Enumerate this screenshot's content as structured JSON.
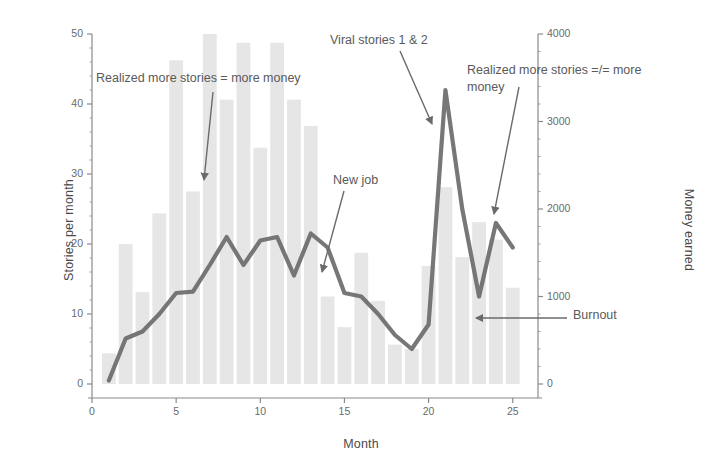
{
  "chart_data": {
    "type": "bar",
    "title": "",
    "subtitle": "",
    "xlabel": "Month",
    "ylabel": "Stories per month",
    "ylabel_right": "Money earned",
    "x": [
      1,
      2,
      3,
      4,
      5,
      6,
      7,
      8,
      9,
      10,
      11,
      12,
      13,
      14,
      15,
      16,
      17,
      18,
      19,
      20,
      21,
      22,
      23,
      24,
      25
    ],
    "categories": [
      "1",
      "2",
      "3",
      "4",
      "5",
      "6",
      "7",
      "8",
      "9",
      "10",
      "11",
      "12",
      "13",
      "14",
      "15",
      "16",
      "17",
      "18",
      "19",
      "20",
      "21",
      "22",
      "23",
      "24",
      "25"
    ],
    "xlim": [
      0,
      26.5
    ],
    "ylim": [
      0,
      50
    ],
    "ylim_right": [
      0,
      4000
    ],
    "xticks": [
      0,
      5,
      10,
      15,
      20,
      25
    ],
    "xtick_labels": [
      "0",
      "5",
      "10",
      "15",
      "20",
      "25"
    ],
    "yticks": [
      0,
      10,
      20,
      30,
      40,
      50
    ],
    "ytick_labels": [
      "0",
      "10",
      "20",
      "30",
      "40",
      "50"
    ],
    "yticks_right": [
      0,
      1000,
      2000,
      3000,
      4000
    ],
    "ytick_labels_right": [
      "0",
      "1000",
      "2000",
      "3000",
      "4000"
    ],
    "grid": false,
    "legend": false,
    "legend_position": "none",
    "bar_color": "#e6e6e6",
    "line_color": "#6b6b6b",
    "series": [
      {
        "name": "Money earned",
        "type": "bar",
        "axis": "right",
        "color": "#e6e6e6",
        "values": [
          350,
          1600,
          1050,
          1950,
          3700,
          2200,
          4000,
          3250,
          3900,
          2700,
          3900,
          3250,
          2950,
          1000,
          650,
          1500,
          950,
          450,
          400,
          1350,
          2250,
          1450,
          1850,
          1650,
          1100
        ]
      },
      {
        "name": "Stories per month",
        "type": "line",
        "axis": "left",
        "color": "#6b6b6b",
        "values": [
          0.5,
          6.5,
          7.5,
          10,
          13,
          13.2,
          17,
          21,
          17,
          20.5,
          21,
          15.5,
          21.5,
          19.5,
          13,
          12.5,
          10,
          7,
          5,
          8.5,
          42,
          25,
          12.5,
          23,
          19.5
        ]
      }
    ],
    "annotations": [
      {
        "id": "realized-more-money",
        "text": "Realized more stories = more money",
        "text_x": 96,
        "text_y": 70,
        "align": "left",
        "arrow_from_x": 213,
        "arrow_from_y": 92,
        "arrow_to_x": 204,
        "arrow_to_y": 180
      },
      {
        "id": "viral-stories",
        "text": "Viral stories 1 & 2",
        "text_x": 330,
        "text_y": 32,
        "align": "left",
        "arrow_from_x": 400,
        "arrow_from_y": 51,
        "arrow_to_x": 432,
        "arrow_to_y": 124
      },
      {
        "id": "new-job",
        "text": "New job",
        "text_x": 333,
        "text_y": 172,
        "align": "left",
        "arrow_from_x": 344,
        "arrow_from_y": 191,
        "arrow_to_x": 322,
        "arrow_to_y": 272
      },
      {
        "id": "realized-not-more-money",
        "text": "Realized more stories =/= more\nmoney",
        "text_x": 467,
        "text_y": 62,
        "align": "left",
        "arrow_from_x": 519,
        "arrow_from_y": 87,
        "arrow_to_x": 494,
        "arrow_to_y": 214
      },
      {
        "id": "burnout",
        "text": "Burnout",
        "text_x": 573,
        "text_y": 307,
        "align": "left",
        "arrow_from_x": 567,
        "arrow_from_y": 318,
        "arrow_to_x": 476,
        "arrow_to_y": 318
      }
    ]
  }
}
